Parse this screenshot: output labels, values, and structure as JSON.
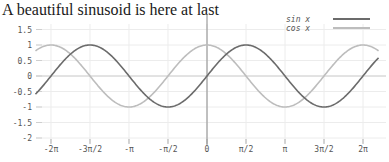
{
  "title": "A beautiful sinusoid is here at last",
  "colors": {
    "sin": "#6b6b6b",
    "cos": "#bdbdbd",
    "grid": "#ececec",
    "axis": "#8a8a8a",
    "zero_line": "#d0d0d0"
  },
  "legend": {
    "items": [
      {
        "label": "sin x",
        "series": "sin"
      },
      {
        "label": "cos x",
        "series": "cos"
      }
    ]
  },
  "chart_data": {
    "type": "line",
    "title": "A beautiful sinusoid is here at last",
    "xlabel": "",
    "ylabel": "",
    "xlim": [
      -6.91,
      6.91
    ],
    "ylim": [
      -2,
      1.5
    ],
    "grid": true,
    "legend_position": "top-right",
    "x_ticks": [
      {
        "value": -6.2832,
        "label": "-2π"
      },
      {
        "value": -4.7124,
        "label": "-3π/2"
      },
      {
        "value": -3.1416,
        "label": "-π"
      },
      {
        "value": -1.5708,
        "label": "-π/2"
      },
      {
        "value": 0,
        "label": "0"
      },
      {
        "value": 1.5708,
        "label": "π/2"
      },
      {
        "value": 3.1416,
        "label": "π"
      },
      {
        "value": 4.7124,
        "label": "3π/2"
      },
      {
        "value": 6.2832,
        "label": "2π"
      }
    ],
    "y_ticks": [
      {
        "value": 1.5,
        "label": "1.5"
      },
      {
        "value": 1,
        "label": "1"
      },
      {
        "value": 0.5,
        "label": "0.5"
      },
      {
        "value": 0,
        "label": "0"
      },
      {
        "value": -0.5,
        "label": "-0.5"
      },
      {
        "value": -1,
        "label": "-1"
      },
      {
        "value": -1.5,
        "label": "-1.5"
      },
      {
        "value": -2,
        "label": "-2"
      }
    ],
    "series": [
      {
        "name": "sin x",
        "function": "sin",
        "x_range": [
          -6.91,
          6.91
        ],
        "x": [
          -6.2832,
          -4.7124,
          -3.1416,
          -1.5708,
          0,
          1.5708,
          3.1416,
          4.7124,
          6.2832
        ],
        "values": [
          0,
          1,
          0,
          -1,
          0,
          1,
          0,
          -1,
          0
        ]
      },
      {
        "name": "cos x",
        "function": "cos",
        "x_range": [
          -6.91,
          6.91
        ],
        "x": [
          -6.2832,
          -4.7124,
          -3.1416,
          -1.5708,
          0,
          1.5708,
          3.1416,
          4.7124,
          6.2832
        ],
        "values": [
          1,
          0,
          -1,
          0,
          1,
          0,
          -1,
          0,
          1
        ]
      }
    ]
  }
}
